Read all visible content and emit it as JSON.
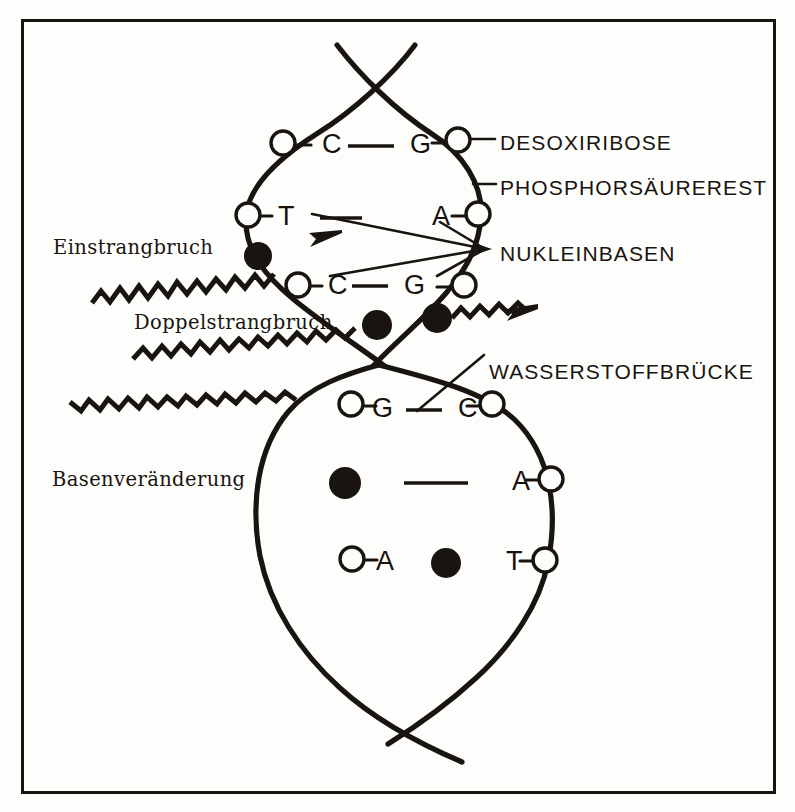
{
  "figure": {
    "frame_color": "#1a1410",
    "ink_color": "#1a1410",
    "background_color": "#fdfdfb"
  },
  "callouts": {
    "right": [
      {
        "id": "desoxiribose",
        "text": "DESOXIRIBOSE",
        "x": 500,
        "y": 132
      },
      {
        "id": "phosphorsaeurerest",
        "text": "PHOSPHORSÄUREREST",
        "x": 500,
        "y": 177
      },
      {
        "id": "nukleinbasen",
        "text": "NUKLEINBASEN",
        "x": 500,
        "y": 243
      },
      {
        "id": "wasserstoffbruecke",
        "text": "WASSERSTOFFBRÜCKE",
        "x": 489,
        "y": 361
      }
    ],
    "left": [
      {
        "id": "einstrangbruch",
        "text": "Einstrangbruch",
        "x": 53,
        "y": 238
      },
      {
        "id": "doppelstrangbruch",
        "text": "Doppelstrangbruch",
        "x": 134,
        "y": 313
      },
      {
        "id": "basenveraenderung",
        "text": "Basenveränderung",
        "x": 52,
        "y": 470
      }
    ]
  },
  "bases": {
    "upper_loop": [
      {
        "id": "upper-pair-1-left",
        "letter": "C",
        "x": 322,
        "y": 131
      },
      {
        "id": "upper-pair-1-right",
        "letter": "G",
        "x": 410,
        "y": 131
      },
      {
        "id": "upper-pair-2-left",
        "letter": "T",
        "x": 278,
        "y": 203
      },
      {
        "id": "upper-pair-2-right",
        "letter": "A",
        "x": 432,
        "y": 203
      },
      {
        "id": "upper-pair-3-left",
        "letter": "C",
        "x": 328,
        "y": 272
      },
      {
        "id": "upper-pair-3-right",
        "letter": "G",
        "x": 404,
        "y": 272
      }
    ],
    "lower_loop": [
      {
        "id": "lower-pair-1-left",
        "letter": "G",
        "x": 372,
        "y": 395
      },
      {
        "id": "lower-pair-1-right",
        "letter": "C",
        "x": 458,
        "y": 395
      },
      {
        "id": "lower-pair-2-right",
        "letter": "A",
        "x": 512,
        "y": 468
      },
      {
        "id": "lower-pair-3-left",
        "letter": "A",
        "x": 376,
        "y": 548
      },
      {
        "id": "lower-pair-3-right",
        "letter": "T",
        "x": 506,
        "y": 548
      }
    ]
  },
  "damage_markers": [
    {
      "id": "single-strand-break-dot",
      "kind": "filled-dot",
      "x": 258,
      "y": 256,
      "r": 13
    },
    {
      "id": "double-strand-break-dot-left",
      "kind": "filled-dot",
      "x": 377,
      "y": 325,
      "r": 14
    },
    {
      "id": "double-strand-break-dot-right",
      "kind": "filled-dot",
      "x": 437,
      "y": 318,
      "r": 14
    },
    {
      "id": "base-change-dot-left",
      "kind": "filled-dot",
      "x": 345,
      "y": 483,
      "r": 15
    },
    {
      "id": "base-change-dot-center",
      "kind": "filled-dot",
      "x": 446,
      "y": 563,
      "r": 14
    }
  ],
  "sugar_nodes": {
    "description": "open circles on the backbone representing desoxiribose units",
    "upper_left": [
      [
        283,
        143
      ],
      [
        248,
        215
      ],
      [
        298,
        285
      ]
    ],
    "upper_right": [
      [
        458,
        140
      ],
      [
        478,
        214
      ],
      [
        464,
        285
      ]
    ],
    "lower_left": [
      [
        351,
        404
      ],
      [
        352,
        559
      ]
    ],
    "lower_right": [
      [
        492,
        404
      ],
      [
        551,
        479
      ],
      [
        545,
        560
      ]
    ]
  },
  "hydrogen_bonds": [
    {
      "id": "bond-upper-1",
      "x1": 348,
      "y1": 146,
      "x2": 394,
      "y2": 146
    },
    {
      "id": "bond-upper-2",
      "x1": 318,
      "y1": 218,
      "x2": 360,
      "y2": 218
    },
    {
      "id": "bond-upper-3",
      "x1": 351,
      "y1": 286,
      "x2": 389,
      "y2": 286
    },
    {
      "id": "bond-lower-1",
      "x1": 405,
      "y1": 410,
      "x2": 443,
      "y2": 410
    },
    {
      "id": "bond-lower-2",
      "x1": 404,
      "y1": 483,
      "x2": 466,
      "y2": 483
    }
  ],
  "radiation_tracks": [
    {
      "id": "track-single-strand-break",
      "label_ref": "einstrangbruch"
    },
    {
      "id": "track-double-strand-break",
      "label_ref": "doppelstrangbruch"
    },
    {
      "id": "track-base-change",
      "label_ref": "basenveraenderung"
    }
  ],
  "legend_semantics": {
    "open_circle": "Desoxiribose / Phosphorsäurerest backbone unit",
    "letter": "Nukleinbase (A, T, C, G)",
    "short_dash": "Wasserstoffbrücke",
    "filled_dot": "Strahlenschaden (Bruch bzw. Basenveränderung)",
    "zigzag_arrow": "ionisierende Strahlung"
  }
}
